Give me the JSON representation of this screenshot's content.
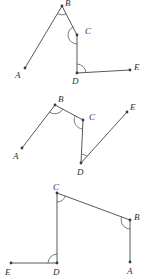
{
  "document": {
    "title": "Angle relationship figures",
    "description": "Three line-and-angle geometry figures stacked vertically",
    "stroke_color": "#585858",
    "arc_color": "#6a6a6a",
    "label_color": "#2e2e2e",
    "background_color": "#ffffff",
    "width": 146,
    "height": 279
  },
  "figures": [
    {
      "id": "figure-top",
      "name": "figure-1",
      "points": {
        "A": {
          "label": "A",
          "x": 25,
          "y": 68,
          "label_x": 15,
          "label_y": 78,
          "dot": true
        },
        "B": {
          "label": "B",
          "x": 62,
          "y": 6,
          "label_x": 65,
          "label_y": 6,
          "dot": true
        },
        "C": {
          "label": "C",
          "x": 77,
          "y": 35,
          "label_x": 85,
          "label_y": 34,
          "dot": true
        },
        "D": {
          "label": "D",
          "x": 77,
          "y": 73,
          "label_x": 72,
          "label_y": 84,
          "dot": true
        },
        "E": {
          "label": "E",
          "x": 130,
          "y": 70,
          "label_x": 134,
          "label_y": 70,
          "dot": true
        }
      },
      "segments": [
        {
          "name": "segment-a-b",
          "from": "A",
          "to": "B"
        },
        {
          "name": "segment-b-c",
          "from": "B",
          "to": "C"
        },
        {
          "name": "segment-c-d",
          "from": "C",
          "to": "D"
        },
        {
          "name": "segment-d-e",
          "from": "D",
          "to": "E"
        }
      ],
      "angle_marks": [
        {
          "name": "angle-mark-b",
          "vertex": "B",
          "radius": 9
        },
        {
          "name": "angle-mark-c",
          "vertex": "C",
          "radius": 9
        },
        {
          "name": "angle-mark-d",
          "vertex": "D",
          "radius": 9
        }
      ]
    },
    {
      "id": "figure-middle",
      "name": "figure-2",
      "points": {
        "A": {
          "label": "A",
          "x": 22,
          "y": 148,
          "label_x": 13,
          "label_y": 159,
          "dot": true
        },
        "B": {
          "label": "B",
          "x": 55,
          "y": 105,
          "label_x": 58,
          "label_y": 102,
          "dot": true
        },
        "C": {
          "label": "C",
          "x": 83,
          "y": 120,
          "label_x": 89,
          "label_y": 120,
          "dot": true
        },
        "D": {
          "label": "D",
          "x": 81,
          "y": 163,
          "label_x": 77,
          "label_y": 175,
          "dot": true
        },
        "E": {
          "label": "E",
          "x": 127,
          "y": 112,
          "label_x": 130,
          "label_y": 110,
          "dot": true
        }
      },
      "segments": [
        {
          "name": "segment-a-b",
          "from": "A",
          "to": "B"
        },
        {
          "name": "segment-b-c",
          "from": "B",
          "to": "C"
        },
        {
          "name": "segment-c-d",
          "from": "C",
          "to": "D"
        },
        {
          "name": "segment-d-e",
          "from": "D",
          "to": "E"
        }
      ],
      "angle_marks": [
        {
          "name": "angle-mark-b",
          "vertex": "B",
          "radius": 9
        },
        {
          "name": "angle-mark-c",
          "vertex": "C",
          "radius": 9
        },
        {
          "name": "angle-mark-d",
          "vertex": "D",
          "radius": 9
        }
      ]
    },
    {
      "id": "figure-bottom",
      "name": "figure-3",
      "points": {
        "A": {
          "label": "A",
          "x": 130,
          "y": 262,
          "label_x": 127,
          "label_y": 274,
          "dot": true
        },
        "B": {
          "label": "B",
          "x": 130,
          "y": 220,
          "label_x": 134,
          "label_y": 220,
          "dot": true
        },
        "C": {
          "label": "C",
          "x": 57,
          "y": 193,
          "label_x": 53,
          "label_y": 190,
          "dot": true
        },
        "D": {
          "label": "D",
          "x": 57,
          "y": 263,
          "label_x": 53,
          "label_y": 275,
          "dot": true
        },
        "E": {
          "label": "E",
          "x": 11,
          "y": 263,
          "label_x": 5,
          "label_y": 275,
          "dot": true
        }
      },
      "segments": [
        {
          "name": "segment-a-b",
          "from": "A",
          "to": "B"
        },
        {
          "name": "segment-b-c",
          "from": "B",
          "to": "C"
        },
        {
          "name": "segment-c-d",
          "from": "C",
          "to": "D"
        },
        {
          "name": "segment-d-e",
          "from": "D",
          "to": "E"
        }
      ],
      "angle_marks": [
        {
          "name": "angle-mark-b",
          "vertex": "B",
          "radius": 9
        },
        {
          "name": "angle-mark-c",
          "vertex": "C",
          "radius": 9
        },
        {
          "name": "angle-mark-d",
          "vertex": "D",
          "radius": 9
        }
      ]
    }
  ]
}
